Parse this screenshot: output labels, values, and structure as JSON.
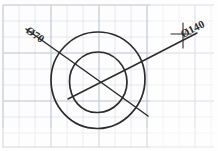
{
  "sheet": {
    "title": "Hand-drawn concentric circle dimension sketch",
    "background_color": "#fdfdfd",
    "paper_type": "graph-paper",
    "grid": {
      "cell_size_px": 16,
      "minor_color": "#d9dce6",
      "major_color": "#c2c7d6",
      "origin_x_px": 3,
      "origin_y_px": 5,
      "columns": 13,
      "rows": 9
    },
    "ink_color": "#2b2b2b"
  },
  "drawing": {
    "type": "concentric-circles",
    "center": {
      "x": 98,
      "y": 81
    },
    "circles": [
      {
        "name": "outer-circle",
        "radius_px": 47,
        "dimension_label": "Ø140",
        "diameter_value": 140
      },
      {
        "name": "inner-circle",
        "radius_px": 29,
        "dimension_label": "Ø70",
        "diameter_value": 70
      }
    ],
    "leaders": [
      {
        "name": "inner-diameter-leader",
        "label": "Ø70",
        "from": {
          "x": 26,
          "y": 29
        },
        "to": {
          "x": 148,
          "y": 116
        },
        "label_position": {
          "x": 29,
          "y": 31
        },
        "label_rotation_deg": 35
      },
      {
        "name": "outer-diameter-leader",
        "label": "Ø140",
        "from": {
          "x": 197,
          "y": 33
        },
        "to": {
          "x": 68,
          "y": 99
        },
        "label_position": {
          "x": 188,
          "y": 34
        },
        "label_rotation_deg": -27
      }
    ],
    "witness_marks": [
      {
        "name": "vertical-tick",
        "x1": 183,
        "y1": 23,
        "x2": 183,
        "y2": 48
      },
      {
        "name": "horizontal-tick",
        "x1": 172,
        "y1": 34,
        "x2": 190,
        "y2": 34
      }
    ]
  },
  "labels": {
    "left_leader_text": "Ø70",
    "right_leader_text": "Ø140"
  }
}
